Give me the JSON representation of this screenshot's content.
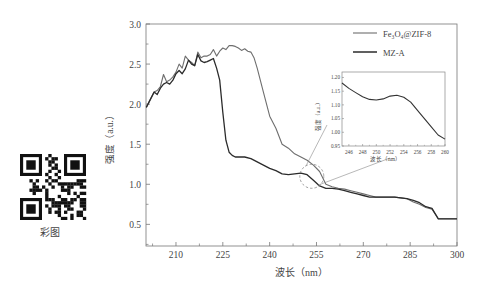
{
  "qr_label": "彩图",
  "chart_data": {
    "type": "line",
    "title": "",
    "xlabel": "波长（nm）",
    "ylabel": "强度（a.u.）",
    "xlim": [
      200.4,
      300
    ],
    "ylim": [
      0.23,
      3.0
    ],
    "x_ticks": [
      210,
      225,
      240,
      255,
      270,
      285,
      300
    ],
    "y_ticks": [
      0.5,
      1.0,
      1.5,
      2.0,
      2.5,
      3.0
    ],
    "y_tick_labels": [
      "0.5",
      "1.0",
      "1.5",
      "2.0",
      "2.5",
      "3.0"
    ],
    "grid": false,
    "legend_position": "upper right",
    "series": [
      {
        "name": "Fe3O4@ZIF-8",
        "legend_label": "Fe₃O₄@ZIF-8",
        "color": "#6e6e6e",
        "x": [
          200.5,
          203,
          204,
          205,
          206,
          207,
          208,
          209,
          210,
          211,
          212,
          213,
          214,
          215,
          216,
          217,
          218,
          219,
          220,
          221,
          222,
          223,
          224,
          225,
          226,
          227,
          228,
          229,
          230,
          231,
          232,
          233,
          234,
          235,
          236,
          237,
          238,
          240,
          242,
          244,
          246,
          248,
          250,
          252,
          254,
          256,
          258,
          260,
          262,
          264,
          266,
          268,
          270,
          272,
          274,
          276,
          278,
          280,
          282,
          284,
          286,
          288,
          290,
          292,
          294,
          296,
          298,
          300
        ],
        "y": [
          1.96,
          2.15,
          2.17,
          2.22,
          2.37,
          2.28,
          2.3,
          2.34,
          2.4,
          2.5,
          2.45,
          2.6,
          2.55,
          2.52,
          2.48,
          2.65,
          2.58,
          2.6,
          2.6,
          2.62,
          2.68,
          2.6,
          2.66,
          2.7,
          2.68,
          2.73,
          2.73,
          2.72,
          2.7,
          2.67,
          2.69,
          2.66,
          2.65,
          2.58,
          2.45,
          2.3,
          2.15,
          1.85,
          1.7,
          1.5,
          1.45,
          1.38,
          1.34,
          1.3,
          1.24,
          1.16,
          1.0,
          0.97,
          0.95,
          0.94,
          0.92,
          0.9,
          0.88,
          0.86,
          0.84,
          0.84,
          0.84,
          0.84,
          0.83,
          0.82,
          0.78,
          0.75,
          0.71,
          0.69,
          0.57,
          0.57,
          0.57,
          0.57
        ]
      },
      {
        "name": "MZ-A",
        "legend_label": "MZ-A",
        "color": "#2b2b2b",
        "x": [
          200.5,
          203,
          204,
          205,
          206,
          207,
          208,
          209,
          210,
          211,
          212,
          213,
          214,
          215,
          216,
          217,
          218,
          219,
          220,
          221,
          222,
          223,
          224,
          225,
          226,
          227,
          228,
          229,
          230,
          232,
          234,
          236,
          238,
          240,
          242,
          244,
          246,
          248,
          250,
          252,
          254,
          256,
          258,
          260,
          262,
          264,
          266,
          268,
          270,
          272,
          274,
          276,
          278,
          280,
          282,
          284,
          286,
          288,
          290,
          292,
          294,
          296,
          298,
          300
        ],
        "y": [
          1.96,
          2.15,
          2.12,
          2.2,
          2.25,
          2.27,
          2.25,
          2.3,
          2.38,
          2.42,
          2.38,
          2.44,
          2.55,
          2.5,
          2.48,
          2.62,
          2.54,
          2.52,
          2.53,
          2.55,
          2.57,
          2.45,
          2.3,
          1.9,
          1.55,
          1.4,
          1.36,
          1.34,
          1.34,
          1.34,
          1.32,
          1.28,
          1.24,
          1.2,
          1.17,
          1.13,
          1.12,
          1.13,
          1.14,
          1.12,
          1.05,
          0.98,
          0.95,
          0.95,
          0.94,
          0.92,
          0.9,
          0.88,
          0.86,
          0.84,
          0.84,
          0.84,
          0.84,
          0.84,
          0.83,
          0.82,
          0.8,
          0.77,
          0.72,
          0.7,
          0.57,
          0.57,
          0.57,
          0.57
        ]
      }
    ],
    "annotations": [
      {
        "type": "dashed-circle",
        "x": 253.5,
        "y": 1.1,
        "note": "zoom region connected to inset"
      }
    ],
    "inset": {
      "type": "line",
      "xlabel": "波长（nm）",
      "ylabel": "强度（a.u.）",
      "xlim": [
        245,
        260
      ],
      "ylim": [
        0.95,
        1.22
      ],
      "x_ticks": [
        246,
        248,
        250,
        252,
        254,
        256,
        258,
        260
      ],
      "y_ticks": [
        0.95,
        1.0,
        1.05,
        1.1,
        1.15,
        1.2
      ],
      "y_tick_labels": [
        "0.95",
        "1.00",
        "1.05",
        "1.10",
        "1.15",
        "1.20"
      ],
      "series": [
        {
          "name": "MZ-A",
          "x": [
            245,
            246,
            247,
            248,
            249,
            250,
            251,
            252,
            253,
            254,
            255,
            256,
            257,
            258,
            259,
            260
          ],
          "y": [
            1.18,
            1.16,
            1.145,
            1.13,
            1.12,
            1.118,
            1.122,
            1.132,
            1.135,
            1.128,
            1.11,
            1.08,
            1.05,
            1.02,
            0.99,
            0.975
          ]
        }
      ]
    }
  }
}
